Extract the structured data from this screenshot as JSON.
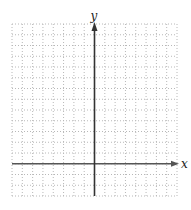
{
  "diagram": {
    "type": "coordinate-grid",
    "grid": {
      "columns": 16,
      "rows": 16,
      "left": 12,
      "top": 24,
      "right": 177,
      "bottom": 196,
      "line_color": "#b8b8b8",
      "line_style": "dotted"
    },
    "axes": {
      "x_axis": {
        "label": "x",
        "cells_from_top": 13,
        "color": "#555555"
      },
      "y_axis": {
        "label": "y",
        "cells_from_left": 8,
        "color": "#333333"
      }
    }
  }
}
